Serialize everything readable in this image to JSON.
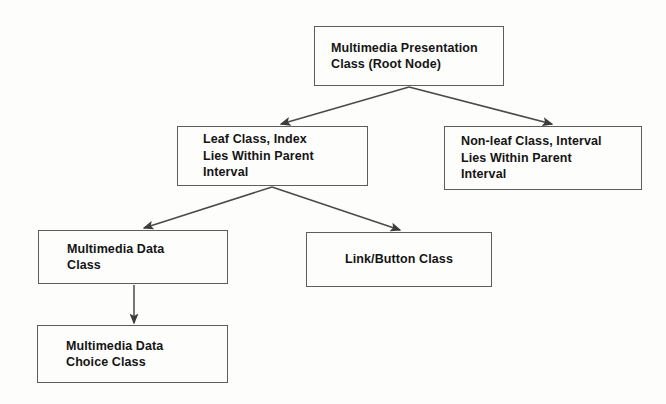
{
  "diagram": {
    "type": "tree",
    "nodes": [
      {
        "id": "root",
        "label": "Multimedia Presentation\nClass (Root Node)",
        "line1": "Multimedia Presentation",
        "line2": "Class (Root Node)"
      },
      {
        "id": "leaf",
        "label": "Leaf Class, Index\nLies Within Parent\nInterval",
        "line1": "Leaf Class, Index",
        "line2": "Lies Within Parent",
        "line3": "Interval"
      },
      {
        "id": "nonleaf",
        "label": "Non-leaf Class, Interval\nLies Within Parent\nInterval",
        "line1": "Non-leaf Class, Interval",
        "line2": "Lies Within Parent",
        "line3": "Interval"
      },
      {
        "id": "mmdata",
        "label": "Multimedia Data\nClass",
        "line1": "Multimedia Data",
        "line2": "Class"
      },
      {
        "id": "linkbutton",
        "label": "Link/Button Class",
        "line1": "Link/Button Class"
      },
      {
        "id": "mmchoice",
        "label": "Multimedia Data\nChoice Class",
        "line1": "Multimedia Data",
        "line2": "Choice Class"
      }
    ],
    "edges": [
      {
        "id": "root-to-leaf",
        "from": "root",
        "to": "leaf",
        "style": "arrow"
      },
      {
        "id": "root-to-nonleaf",
        "from": "root",
        "to": "nonleaf",
        "style": "arrow"
      },
      {
        "id": "leaf-to-mmdata",
        "from": "leaf",
        "to": "mmdata",
        "style": "arrow"
      },
      {
        "id": "leaf-to-linkbutton",
        "from": "leaf",
        "to": "linkbutton",
        "style": "arrow"
      },
      {
        "id": "mmdata-to-mmchoice",
        "from": "mmdata",
        "to": "mmchoice",
        "style": "arrow"
      }
    ],
    "colors": {
      "background": "#fdfdfc",
      "box_border": "#5d5d5d",
      "text": "#151515",
      "edge": "#4a4a4a"
    }
  }
}
